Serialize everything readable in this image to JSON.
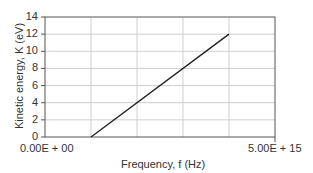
{
  "chart_data": {
    "type": "line",
    "title": "",
    "xlabel": "Frequency, f (Hz)",
    "ylabel": "Kinetic energy, K (eV)",
    "xlim": [
      0,
      5000000000000000.0
    ],
    "ylim": [
      0,
      14
    ],
    "x_tick_labels": [
      "0.00E + 00",
      "5.00E + 15"
    ],
    "y_ticks": [
      0,
      2,
      4,
      6,
      8,
      10,
      12,
      14
    ],
    "grid": true,
    "legend": null,
    "series": [
      {
        "name": "K vs f",
        "x": [
          1000000000000000.0,
          4000000000000000.0
        ],
        "y": [
          0,
          12
        ]
      }
    ]
  },
  "labels": {
    "xlabel": "Frequency, f (Hz)",
    "ylabel": "Kinetic energy, K (eV)",
    "xmin": "0.00E + 00",
    "xmax": "5.00E + 15",
    "yticks": [
      "14",
      "12",
      "10",
      "8",
      "6",
      "4",
      "2",
      "0"
    ]
  }
}
